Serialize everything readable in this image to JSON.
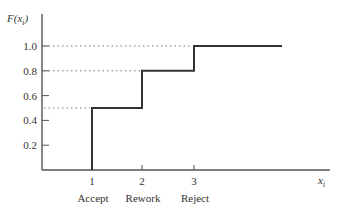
{
  "chart_data": {
    "type": "line",
    "subtype": "step-cdf",
    "title": "",
    "ylabel": "F(x_i)",
    "ylabel_display": {
      "main": "F(x",
      "sub": "i",
      "close": ")"
    },
    "xlabel": "x_i",
    "xlabel_display": {
      "main": "x",
      "sub": "i"
    },
    "x": [
      1,
      2,
      3
    ],
    "x_tick_labels": [
      "1",
      "2",
      "3"
    ],
    "x_category_labels": [
      "Accept",
      "Rework",
      "Reject"
    ],
    "values": [
      0.5,
      0.8,
      1.0
    ],
    "y_ticks": [
      0.2,
      0.4,
      0.6,
      0.8,
      1.0
    ],
    "y_tick_labels": [
      "0.2",
      "0.4",
      "0.6",
      "0.8",
      "1.0"
    ],
    "ylim": [
      0,
      1.1
    ],
    "reference_lines": [
      {
        "y": 0.5,
        "style": "dotted"
      },
      {
        "y": 0.8,
        "style": "dotted"
      },
      {
        "y": 1.0,
        "style": "dotted"
      }
    ],
    "grid": false,
    "legend": null
  },
  "colors": {
    "line": "#333333",
    "axis": "#555555",
    "dotted": "#777777",
    "background": "#ffffff"
  }
}
